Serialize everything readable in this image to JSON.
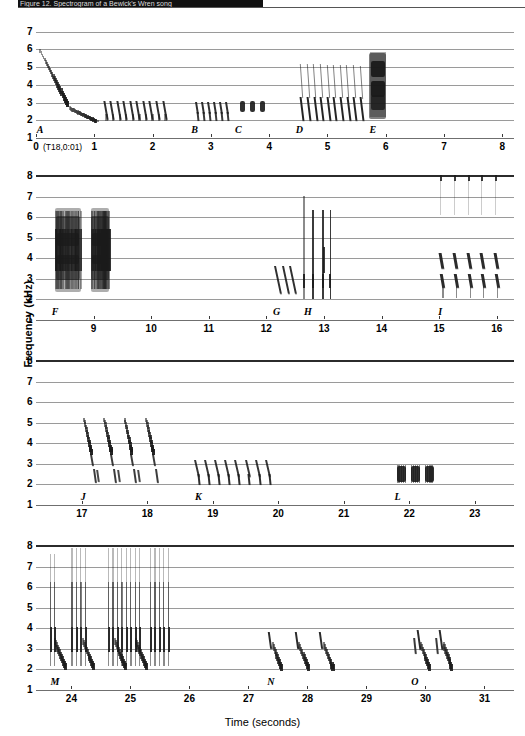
{
  "figure": {
    "caption_fragment": "Figure 12. Spectrogram of a Bewick's Wren song",
    "axis_x_title": "Time (seconds)",
    "axis_y_title": "Frequency (kHz)",
    "annotation": "(T18,0:01)",
    "line_color": "#9a9a9a",
    "bold_line_color": "#2b2b2b",
    "trace_color": "#1a1a1a"
  },
  "chart_data": {
    "type": "heatmap",
    "xlabel": "Time (seconds)",
    "ylabel": "Frequency (kHz)",
    "ylim": [
      1,
      8
    ],
    "yticks": [
      1,
      2,
      3,
      4,
      5,
      6,
      7,
      8
    ],
    "grid": true,
    "legend": "none",
    "panels": [
      {
        "index": 1,
        "xlim": [
          0,
          8.2
        ],
        "xticks": [
          "0",
          "1",
          "2",
          "3",
          "4",
          "5",
          "6",
          "7",
          "8"
        ],
        "xtick_values": [
          0,
          1,
          2,
          3,
          4,
          5,
          6,
          7,
          8
        ],
        "yticks_visible": [
          "7",
          "6",
          "5",
          "4",
          "3",
          "2",
          "1"
        ],
        "annotation": "(T18,0:01)",
        "annotation_x": 0.12,
        "syllables": [
          {
            "label": "A",
            "x": 0.07
          },
          {
            "label": "B",
            "x": 2.72
          },
          {
            "label": "C",
            "x": 3.47
          },
          {
            "label": "D",
            "x": 4.52
          },
          {
            "label": "E",
            "x": 5.78
          }
        ]
      },
      {
        "index": 2,
        "xlim": [
          8,
          16.3
        ],
        "xticks": [
          "9",
          "10",
          "11",
          "12",
          "13",
          "14",
          "15",
          "16"
        ],
        "xtick_values": [
          9,
          10,
          11,
          12,
          13,
          14,
          15,
          16
        ],
        "yticks_visible": [
          "8",
          "7",
          "6",
          "5",
          "4",
          "3",
          "2",
          "1"
        ],
        "syllables": [
          {
            "label": "F",
            "x": 8.33
          },
          {
            "label": "G",
            "x": 12.18
          },
          {
            "label": "H",
            "x": 12.72
          },
          {
            "label": "I",
            "x": 15.02
          }
        ]
      },
      {
        "index": 3,
        "xlim": [
          16.3,
          23.6
        ],
        "xticks": [
          "17",
          "18",
          "19",
          "20",
          "21",
          "22",
          "23"
        ],
        "xtick_values": [
          17,
          18,
          19,
          20,
          21,
          22,
          23
        ],
        "yticks_visible": [
          "8",
          "7",
          "6",
          "5",
          "4",
          "3",
          "2",
          "1"
        ],
        "syllables": [
          {
            "label": "J",
            "x": 17.02
          },
          {
            "label": "K",
            "x": 18.78
          },
          {
            "label": "L",
            "x": 21.82
          }
        ]
      },
      {
        "index": 4,
        "xlim": [
          23.4,
          31.5
        ],
        "xticks": [
          "24",
          "25",
          "26",
          "27",
          "28",
          "29",
          "30",
          "31"
        ],
        "xtick_values": [
          24,
          25,
          26,
          27,
          28,
          29,
          30,
          31
        ],
        "yticks_visible": [
          "8",
          "7",
          "6",
          "5",
          "4",
          "3",
          "2",
          "1"
        ],
        "syllables": [
          {
            "label": "M",
            "x": 23.72
          },
          {
            "label": "N",
            "x": 27.38
          },
          {
            "label": "O",
            "x": 29.82
          }
        ]
      }
    ],
    "song_elements": [
      {
        "id": "A",
        "panel": 1,
        "t_start": 0.05,
        "t_end": 1.05,
        "f_low": 1.9,
        "f_high": 6.0,
        "type": "downslur-pair"
      },
      {
        "id": "A2",
        "panel": 1,
        "t_start": 1.15,
        "t_end": 2.18,
        "f_low": 2.0,
        "f_high": 3.1,
        "type": "trill",
        "n_notes": 10
      },
      {
        "id": "B",
        "panel": 1,
        "t_start": 2.72,
        "t_end": 3.35,
        "f_low": 1.95,
        "f_high": 3.1,
        "type": "buzz",
        "n_notes": 6
      },
      {
        "id": "C",
        "panel": 1,
        "t_start": 3.47,
        "t_end": 4.0,
        "f_low": 2.5,
        "f_high": 3.1,
        "type": "rattle",
        "n_notes": 3
      },
      {
        "id": "D",
        "panel": 1,
        "t_start": 4.52,
        "t_end": 5.65,
        "f_low": 1.95,
        "f_high": 5.2,
        "type": "trill",
        "n_notes": 10
      },
      {
        "id": "E",
        "panel": 1,
        "t_start": 5.72,
        "t_end": 6.0,
        "f_low": 2.0,
        "f_high": 5.8,
        "type": "broadband-buzz"
      },
      {
        "id": "F",
        "panel": 2,
        "t_start": 8.33,
        "t_end": 9.25,
        "f_low": 2.3,
        "f_high": 6.4,
        "type": "broadband-buzz",
        "n_notes": 2
      },
      {
        "id": "G",
        "panel": 2,
        "t_start": 12.18,
        "t_end": 12.6,
        "f_low": 2.2,
        "f_high": 3.6,
        "type": "downslur",
        "n_notes": 3
      },
      {
        "id": "H",
        "panel": 2,
        "t_start": 12.62,
        "t_end": 13.12,
        "f_low": 2.0,
        "f_high": 7.1,
        "type": "high-note",
        "n_notes": 4
      },
      {
        "id": "I",
        "panel": 2,
        "t_start": 14.98,
        "t_end": 16.1,
        "f_low": 2.0,
        "f_high": 8.0,
        "type": "two-band",
        "n_notes": 5
      },
      {
        "id": "J",
        "panel": 3,
        "t_start": 17.0,
        "t_end": 18.35,
        "f_low": 2.0,
        "f_high": 5.4,
        "type": "downslur",
        "n_notes": 4
      },
      {
        "id": "K",
        "panel": 3,
        "t_start": 18.72,
        "t_end": 19.95,
        "f_low": 1.95,
        "f_high": 3.2,
        "type": "downslur",
        "n_notes": 8
      },
      {
        "id": "L",
        "panel": 3,
        "t_start": 21.8,
        "t_end": 22.45,
        "f_low": 2.1,
        "f_high": 2.9,
        "type": "buzz",
        "n_notes": 3
      },
      {
        "id": "M",
        "panel": 4,
        "t_start": 23.6,
        "t_end": 25.8,
        "f_low": 2.1,
        "f_high": 7.9,
        "type": "complex-trill"
      },
      {
        "id": "N",
        "panel": 4,
        "t_start": 27.35,
        "t_end": 28.55,
        "f_low": 2.1,
        "f_high": 3.8,
        "type": "downslur",
        "n_notes": 3
      },
      {
        "id": "O",
        "panel": 4,
        "t_start": 29.8,
        "t_end": 30.45,
        "f_low": 2.2,
        "f_high": 3.9,
        "type": "downslur",
        "n_notes": 2
      }
    ]
  }
}
